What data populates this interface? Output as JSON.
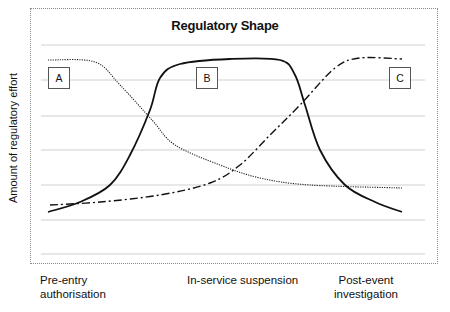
{
  "title": "Regulatory Shape",
  "y_axis_label": "Amount of regulatory effort",
  "x_labels": {
    "a": "Pre-entry\nauthorisation",
    "a_line1": "Pre-entry",
    "a_line2": "authorisation",
    "b": "In-service suspension",
    "c_line1": "Post-event",
    "c_line2": "investigation"
  },
  "boxes": [
    {
      "label": "A",
      "x": 48,
      "y": 67
    },
    {
      "label": "B",
      "x": 196,
      "y": 67
    },
    {
      "label": "C",
      "x": 389,
      "y": 67
    }
  ],
  "colors": {
    "grid": "#d0d0d0",
    "curve": "#111111",
    "frame": "#8a8a8a"
  },
  "chart_data": {
    "type": "line",
    "title": "Regulatory Shape",
    "xlabel": "",
    "ylabel": "Amount of regulatory effort",
    "x_tick_labels": [
      "Pre-entry authorisation",
      "In-service suspension",
      "Post-event investigation"
    ],
    "grid": true,
    "gridlines_y_px": [
      45,
      80,
      116,
      150,
      185,
      220,
      254
    ],
    "legend": [
      "A",
      "B",
      "C"
    ],
    "series": [
      {
        "name": "A (dotted) – pre-entry authorisation",
        "style": "dotted",
        "points_px": [
          [
            48,
            60
          ],
          [
            95,
            62
          ],
          [
            120,
            85
          ],
          [
            152,
            120
          ],
          [
            175,
            145
          ],
          [
            220,
            165
          ],
          [
            260,
            178
          ],
          [
            310,
            185
          ],
          [
            402,
            188
          ]
        ]
      },
      {
        "name": "B (solid) – in-service suspension",
        "style": "solid",
        "points_px": [
          [
            48,
            212
          ],
          [
            80,
            202
          ],
          [
            110,
            185
          ],
          [
            130,
            155
          ],
          [
            150,
            110
          ],
          [
            160,
            78
          ],
          [
            180,
            64
          ],
          [
            230,
            59
          ],
          [
            280,
            60
          ],
          [
            295,
            75
          ],
          [
            305,
            105
          ],
          [
            320,
            150
          ],
          [
            345,
            185
          ],
          [
            375,
            202
          ],
          [
            402,
            212
          ]
        ]
      },
      {
        "name": "C (dash-dot) – post-event investigation",
        "style": "dash-dot",
        "points_px": [
          [
            50,
            205
          ],
          [
            100,
            202
          ],
          [
            160,
            195
          ],
          [
            210,
            183
          ],
          [
            240,
            165
          ],
          [
            270,
            135
          ],
          [
            300,
            105
          ],
          [
            335,
            68
          ],
          [
            360,
            58
          ],
          [
            402,
            59
          ]
        ]
      }
    ]
  }
}
